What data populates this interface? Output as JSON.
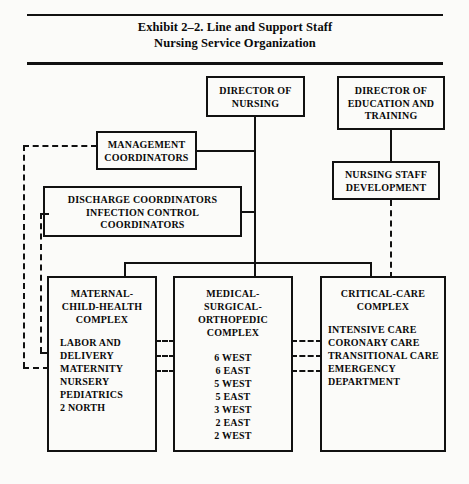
{
  "exhibit": {
    "title_line1": "Exhibit 2–2.   Line and Support Staff",
    "title_line2": "Nursing Service Organization"
  },
  "nodes": {
    "director_nursing": {
      "label": "DIRECTOR OF\nNURSING"
    },
    "director_education": {
      "label": "DIRECTOR OF\nEDUCATION AND\nTRAINING"
    },
    "management_coordinators": {
      "label": "MANAGEMENT\nCOORDINATORS"
    },
    "nursing_staff_development": {
      "label": "NURSING STAFF\nDEVELOPMENT"
    },
    "discharge_coordinators": {
      "label": "DISCHARGE COORDINATORS\nINFECTION CONTROL\nCOORDINATORS"
    },
    "maternal_complex": {
      "title": "MATERNAL-\nCHILD-HEALTH\nCOMPLEX",
      "units": "LABOR AND\n     DELIVERY\nMATERNITY\nNURSERY\nPEDIATRICS\n2 NORTH"
    },
    "medical_complex": {
      "title": "MEDICAL-\nSURGICAL-\nORTHOPEDIC\nCOMPLEX",
      "units": "6 WEST\n6 EAST\n5 WEST\n5 EAST\n3 WEST\n2 EAST\n2 WEST"
    },
    "critical_complex": {
      "title": "CRITICAL-CARE\nCOMPLEX",
      "units": "INTENSIVE CARE\nCORONARY CARE\nTRANSITIONAL CARE\nEMERGENCY\n    DEPARTMENT"
    }
  },
  "colors": {
    "ink": "#111111",
    "page": "#fbfbf9"
  }
}
